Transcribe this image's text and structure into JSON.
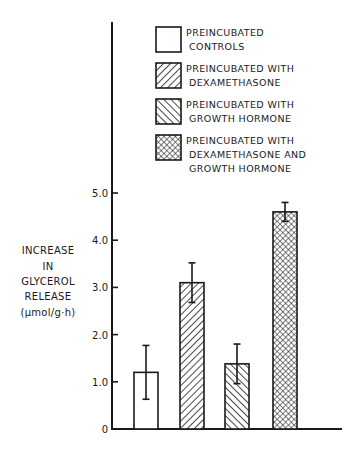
{
  "chart_data": {
    "type": "bar",
    "title": "",
    "xlabel": "",
    "ylabel": "INCREASE IN GLYCEROL RELEASE (μmol/g·h)",
    "ylabel_lines": [
      "INCREASE",
      "IN",
      "GLYCEROL",
      "RELEASE",
      "(μmol/g·h)"
    ],
    "ylim": [
      0,
      5.0
    ],
    "yticks": [
      0,
      1.0,
      2.0,
      3.0,
      4.0,
      5.0
    ],
    "ytick_labels": [
      "0",
      "1.0",
      "2.0",
      "3.0",
      "4.0",
      "5.0"
    ],
    "grid": false,
    "legend_position": "top-right",
    "categories": [
      "PREINCUBATED CONTROLS",
      "PREINCUBATED WITH DEXAMETHASONE",
      "PREINCUBATED WITH GROWTH HORMONE",
      "PREINCUBATED WITH DEXAMETHASONE AND GROWTH HORMONE"
    ],
    "values": [
      1.2,
      3.1,
      1.38,
      4.6
    ],
    "error_bars": [
      0.57,
      0.42,
      0.42,
      0.2
    ],
    "series": [
      {
        "name": "PREINCUBATED CONTROLS",
        "value": 1.2,
        "error": 0.57,
        "pattern": "none"
      },
      {
        "name": "PREINCUBATED WITH DEXAMETHASONE",
        "value": 3.1,
        "error": 0.42,
        "pattern": "diagonal-forward"
      },
      {
        "name": "PREINCUBATED WITH GROWTH HORMONE",
        "value": 1.38,
        "error": 0.42,
        "pattern": "diagonal-backward"
      },
      {
        "name": "PREINCUBATED WITH DEXAMETHASONE AND GROWTH HORMONE",
        "value": 4.6,
        "error": 0.2,
        "pattern": "crosshatch"
      }
    ]
  },
  "legend": {
    "items": [
      {
        "lines": [
          "PREINCUBATED",
          "CONTROLS"
        ],
        "pattern": "none"
      },
      {
        "lines": [
          "PREINCUBATED WITH",
          "DEXAMETHASONE"
        ],
        "pattern": "diagonal-forward"
      },
      {
        "lines": [
          "PREINCUBATED WITH",
          "GROWTH HORMONE"
        ],
        "pattern": "diagonal-backward"
      },
      {
        "lines": [
          "PREINCUBATED WITH",
          "DEXAMETHASONE AND",
          "GROWTH HORMONE"
        ],
        "pattern": "crosshatch"
      }
    ]
  },
  "colors": {
    "ink": "#1a1a1a",
    "background": "#ffffff"
  }
}
